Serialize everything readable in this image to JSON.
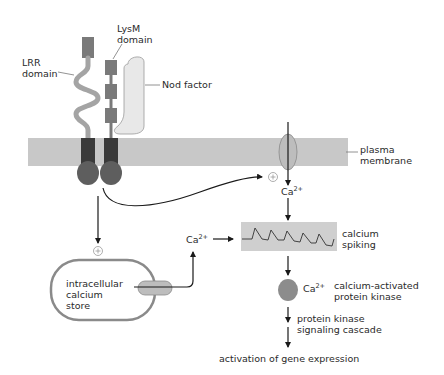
{
  "diagram": {
    "labels": {
      "lrr_domain": "LRR\ndomain",
      "lysm_domain": "LysM\ndomain",
      "nod_factor": "Nod factor",
      "plasma_membrane": "plasma\nmembrane",
      "calcium_spiking": "calcium\nspiking",
      "intracellular_calcium_store": "intracellular\ncalcium\nstore",
      "ca_membrane": "Ca",
      "ca_store": "Ca",
      "ca_kinase": "Ca",
      "ca_superscript": "2+",
      "calcium_activated_protein_kinase": "calcium-activated\nprotein kinase",
      "protein_kinase_signaling_cascade": "protein kinase\nsignaling cascade",
      "activation_of_gene_expression": "activation of gene expression",
      "plus_symbol": "+"
    },
    "colors": {
      "membrane": "#c8c8c8",
      "receptor_head": "#7a7a7a",
      "lrr_stalk": "#a4a4a4",
      "transmembrane": "#3a3a3a",
      "kinase_domain": "#5e5e5e",
      "nod_factor": "#e8e8e8",
      "channel": "#bdbdbd",
      "store_outline": "#8a8a8a",
      "spiking_box": "#cfcfcf",
      "arrow": "#1a1a1a",
      "kinase_protein": "#8c8c8c"
    }
  }
}
